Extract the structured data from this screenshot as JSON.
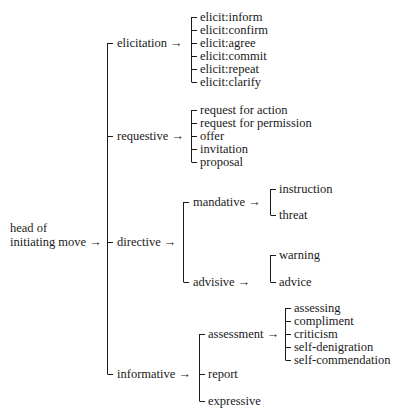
{
  "root": {
    "label_line1": "head of",
    "label_line2": "initiating move →",
    "children": [
      {
        "label": "elicitation →",
        "children": [
          "elicit:inform",
          "elicit:confirm",
          "elicit:agree",
          "elicit:commit",
          "elicit:repeat",
          "elicit:clarify"
        ]
      },
      {
        "label": "requestive →",
        "children": [
          "request for action",
          "request for permission",
          "offer",
          "invitation",
          "proposal"
        ]
      },
      {
        "label": "directive →",
        "children": [
          {
            "label": "mandative →",
            "children": [
              "instruction",
              "threat"
            ]
          },
          {
            "label": "advisive →",
            "children": [
              "warning",
              "advice"
            ]
          }
        ]
      },
      {
        "label": "informative →",
        "children": [
          {
            "label": "assessment →",
            "children": [
              "assessing",
              "compliment",
              "criticism",
              "self-denigration",
              "self-commendation"
            ]
          },
          {
            "label": "report"
          },
          {
            "label": "expressive"
          }
        ]
      }
    ]
  }
}
